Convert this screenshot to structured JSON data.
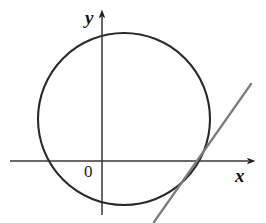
{
  "figure": {
    "background_color": "#ffffff",
    "width": 266,
    "height": 223
  },
  "labels": {
    "x_axis": "x",
    "y_axis": "y",
    "origin": "0"
  },
  "colors": {
    "curve_stroke": "#2b2725",
    "axis_stroke": "#3a3633",
    "line_stroke": "#7d7b79",
    "text": "#15110f"
  },
  "chart_data": {
    "type": "scatter",
    "title": "",
    "xlabel": "x",
    "ylabel": "y",
    "grid": false,
    "legend": null,
    "axes": {
      "x_axis": {
        "label": "x",
        "pixel_y": 161,
        "pixel_x_start": 10,
        "pixel_x_end": 252,
        "arrow": "right",
        "tick_labels": []
      },
      "y_axis": {
        "label": "y",
        "pixel_x": 102,
        "pixel_y_start": 215,
        "pixel_y_end": 12,
        "arrow": "up",
        "tick_labels": []
      },
      "origin": {
        "label": "0",
        "pixel_x": 102,
        "pixel_y": 161
      }
    },
    "shapes": [
      {
        "name": "circle",
        "type": "circle",
        "center_px": [
          124,
          119
        ],
        "radius_px": 86,
        "stroke": "#2b2725",
        "stroke_width": 2.1,
        "fill": "none"
      },
      {
        "name": "tangent-line",
        "type": "line",
        "start_px": [
          251,
          84
        ],
        "end_px": [
          154,
          222
        ],
        "stroke": "#7d7b79",
        "stroke_width": 2.2,
        "x_axis_crossing_px": [
          192,
          161
        ]
      }
    ]
  }
}
